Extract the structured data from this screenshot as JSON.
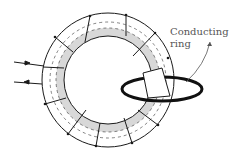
{
  "figure": {
    "label_line1": "Conducting",
    "label_line2": "ring",
    "colors": {
      "stroke": "#1a1a1a",
      "shade": "#d8d8d8",
      "label": "#555555"
    }
  }
}
